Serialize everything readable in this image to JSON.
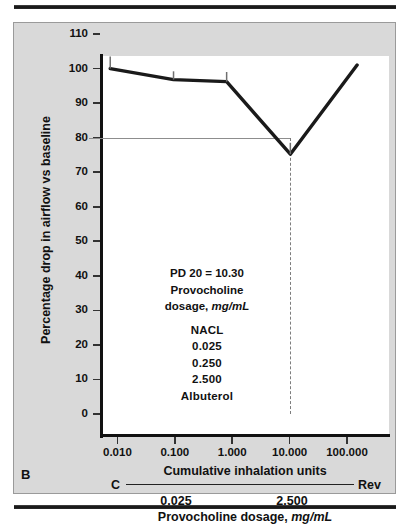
{
  "figure": {
    "panel_letter": "B",
    "annotation": {
      "line1": "PD 20 = 10.30",
      "line2": "Provocholine",
      "line3_prefix": "dosage, ",
      "line3_em": "mg/mL",
      "items": [
        "NACL",
        "0.025",
        "0.250",
        "2.500",
        "Albuterol"
      ]
    },
    "captions": {
      "x_axis_title": "Cumulative inhalation units",
      "c_label": "C",
      "rev_label": "Rev",
      "dose_low": "0.025",
      "dose_high": "2.500",
      "dose_title_prefix": "Provocholine dosage, ",
      "dose_title_em": "mg/mL"
    },
    "colors": {
      "panel_background": "#d9d9d9",
      "plot_background": "#ffffff",
      "axis": "#111111",
      "series_line": "#1a1a1a",
      "reference_line": "#8d8d8d",
      "dashed_line": "#7d7d7d",
      "rule": "#111111"
    }
  },
  "chart_data": {
    "type": "line",
    "title": "",
    "xlabel": "Cumulative inhalation units",
    "ylabel": "Percentage drop in airflow vs baseline",
    "xscale": "log",
    "xlim": [
      0.0032,
      320
    ],
    "ylim": [
      0,
      110
    ],
    "grid": false,
    "legend": "none",
    "xticks": [
      0.01,
      0.1,
      1.0,
      10.0,
      100.0
    ],
    "xticklabels": [
      "0.010",
      "0.100",
      "1.000",
      "10.000",
      "100.000"
    ],
    "yticks": [
      0,
      10,
      20,
      30,
      40,
      50,
      60,
      70,
      80,
      90,
      100,
      110
    ],
    "yticklabels": [
      "0",
      "10",
      "20",
      "30",
      "40",
      "50",
      "60",
      "70",
      "80",
      "90",
      "100",
      "110"
    ],
    "series": [
      {
        "name": "Percentage drop in airflow vs baseline",
        "x": [
          0.0075,
          0.095,
          0.8,
          10.3,
          150.0
        ],
        "y": [
          100,
          96.8,
          96.2,
          75.2,
          101
        ],
        "errorbar_upper": [
          103.5,
          99.2,
          99.0,
          78.5,
          null
        ]
      }
    ],
    "annotations": [
      {
        "text": "PD 20 = 10.30",
        "x": 0.55,
        "y": 40
      },
      {
        "text": "Provocholine dosage, mg/mL",
        "x": 0.55,
        "y": 33
      },
      {
        "text": "NACL",
        "x": 0.55,
        "y": 24
      },
      {
        "text": "0.025",
        "x": 0.55,
        "y": 20
      },
      {
        "text": "0.250",
        "x": 0.55,
        "y": 15
      },
      {
        "text": "2.500",
        "x": 0.55,
        "y": 10
      },
      {
        "text": "Albuterol",
        "x": 0.55,
        "y": 5
      }
    ],
    "reference_lines": [
      {
        "orientation": "horizontal",
        "value": 80,
        "x_from": 0.0032,
        "x_to": 10.3,
        "style": "solid"
      },
      {
        "orientation": "vertical",
        "value": 10.3,
        "y_from": 0,
        "y_to": 80,
        "style": "dashed"
      }
    ]
  }
}
